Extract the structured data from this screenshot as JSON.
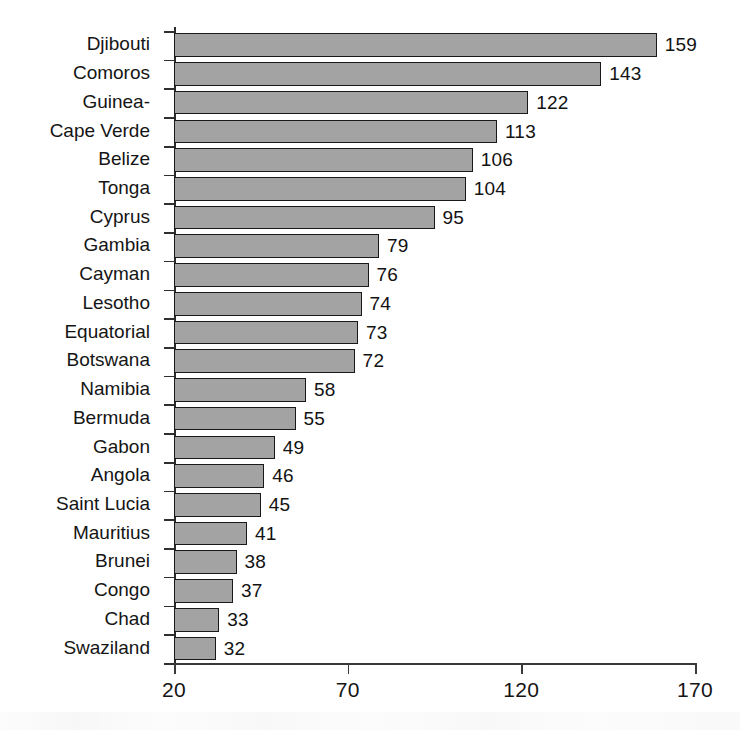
{
  "chart_data": {
    "type": "bar",
    "orientation": "horizontal",
    "title": "",
    "subtitle": "",
    "xlabel": "",
    "ylabel": "",
    "xlim": [
      20,
      170
    ],
    "xticks": [
      20,
      70,
      120,
      170
    ],
    "xtick_labels": [
      "20",
      "70",
      "120",
      "170"
    ],
    "grid": false,
    "legend": null,
    "bar_color": "#a3a3a3",
    "bar_edge_color": "#191919",
    "axis_color": "#2f2f2f",
    "value_labels_shown": true,
    "categories": [
      "Djibouti",
      "Comoros",
      "Guinea-",
      "Cape Verde",
      "Belize",
      "Tonga",
      "Cyprus",
      "Gambia",
      "Cayman",
      "Lesotho",
      "Equatorial",
      "Botswana",
      "Namibia",
      "Bermuda",
      "Gabon",
      "Angola",
      "Saint Lucia",
      "Mauritius",
      "Brunei",
      "Congo",
      "Chad",
      "Swaziland"
    ],
    "values": [
      159,
      143,
      122,
      113,
      106,
      104,
      95,
      79,
      76,
      74,
      73,
      72,
      58,
      55,
      49,
      46,
      45,
      41,
      38,
      37,
      33,
      32
    ],
    "value_label_texts": [
      "159",
      "143",
      "122",
      "113",
      "106",
      "104",
      "95",
      "79",
      "76",
      "74",
      "73",
      "72",
      "58",
      "55",
      "49",
      "46",
      "45",
      "41",
      "38",
      "37",
      "33",
      "32"
    ]
  }
}
